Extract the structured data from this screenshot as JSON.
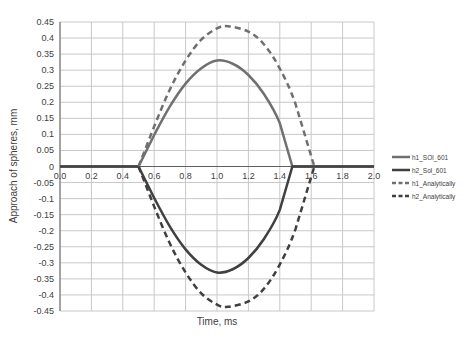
{
  "chart_data": {
    "type": "line",
    "title": "",
    "xlabel": "Time, ms",
    "ylabel": "Approach of spheres, mm",
    "xlim": [
      0.0,
      2.0
    ],
    "ylim": [
      -0.45,
      0.45
    ],
    "x_ticks": [
      "0.0",
      "0.2",
      "0.4",
      "0.6",
      "0.8",
      "1.0",
      "1.2",
      "1.4",
      "1.6",
      "1.8",
      "2.0"
    ],
    "y_ticks": [
      "0.45",
      "0.4",
      "0.35",
      "0.3",
      "0.25",
      "0.2",
      "0.15",
      "0.1",
      "0.05",
      "0",
      "-0.05",
      "-0.1",
      "-0.15",
      "-0.2",
      "-0.25",
      "-0.3",
      "-0.35",
      "-0.4",
      "-0.45"
    ],
    "grid": true,
    "legend_position": "right",
    "series": [
      {
        "name": "h1_SOl_601",
        "style": "solid",
        "color": "#707070",
        "x": [
          0.0,
          0.5,
          0.6,
          0.7,
          0.8,
          0.9,
          1.0,
          1.1,
          1.2,
          1.3,
          1.4,
          1.48,
          2.0
        ],
        "y": [
          0.0,
          0.0,
          0.098,
          0.187,
          0.258,
          0.306,
          0.33,
          0.32,
          0.285,
          0.225,
          0.135,
          0.0,
          0.0
        ]
      },
      {
        "name": "h2_Sol_601",
        "style": "solid",
        "color": "#404040",
        "x": [
          0.0,
          0.5,
          0.6,
          0.7,
          0.8,
          0.9,
          1.0,
          1.1,
          1.2,
          1.3,
          1.4,
          1.48,
          2.0
        ],
        "y": [
          0.0,
          0.0,
          -0.098,
          -0.187,
          -0.258,
          -0.306,
          -0.33,
          -0.32,
          -0.285,
          -0.225,
          -0.135,
          0.0,
          0.0
        ]
      },
      {
        "name": "h1_Analytically",
        "style": "dashed",
        "color": "#707070",
        "x": [
          0.5,
          0.6,
          0.7,
          0.8,
          0.9,
          1.0,
          1.07,
          1.2,
          1.3,
          1.4,
          1.5,
          1.62
        ],
        "y": [
          0.0,
          0.125,
          0.24,
          0.33,
          0.395,
          0.43,
          0.437,
          0.42,
          0.38,
          0.305,
          0.195,
          0.0
        ]
      },
      {
        "name": "h2_Analytically",
        "style": "dashed",
        "color": "#404040",
        "x": [
          0.5,
          0.6,
          0.7,
          0.8,
          0.9,
          1.0,
          1.07,
          1.2,
          1.3,
          1.4,
          1.5,
          1.62
        ],
        "y": [
          0.0,
          -0.125,
          -0.24,
          -0.33,
          -0.395,
          -0.43,
          -0.437,
          -0.42,
          -0.38,
          -0.305,
          -0.195,
          0.0
        ]
      }
    ]
  }
}
